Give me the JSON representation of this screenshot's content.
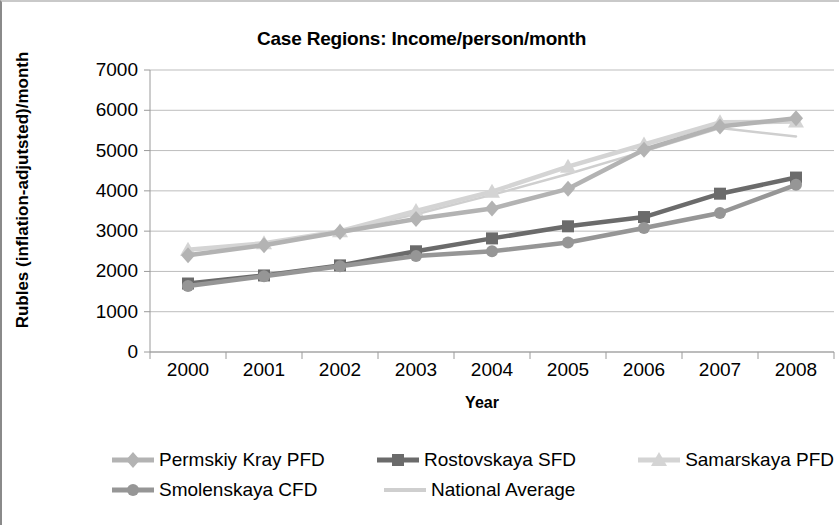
{
  "chart_data": {
    "type": "line",
    "title": "Case Regions: Income/person/month",
    "xlabel": "Year",
    "ylabel": "Rubles (inflation-adjutsted)/month",
    "categories": [
      "2000",
      "2001",
      "2002",
      "2003",
      "2004",
      "2005",
      "2006",
      "2007",
      "2008"
    ],
    "x": [
      2000,
      2001,
      2002,
      2003,
      2004,
      2005,
      2006,
      2007,
      2008
    ],
    "ylim": [
      0,
      7000
    ],
    "yticks": [
      "0",
      "1000",
      "2000",
      "3000",
      "4000",
      "5000",
      "6000",
      "7000"
    ],
    "ytick_values": [
      0,
      1000,
      2000,
      3000,
      4000,
      5000,
      6000,
      7000
    ],
    "grid": true,
    "legend_position": "bottom",
    "series": [
      {
        "name": "Permskiy Kray PFD",
        "marker": "diamond",
        "color": "#b3b3b3",
        "values": [
          2400,
          2650,
          2980,
          3300,
          3560,
          4050,
          5020,
          5600,
          5800
        ]
      },
      {
        "name": "Rostovskaya SFD",
        "marker": "square",
        "color": "#6b6b6b",
        "values": [
          1700,
          1900,
          2150,
          2500,
          2820,
          3120,
          3350,
          3930,
          4330
        ]
      },
      {
        "name": "Samarskaya PFD",
        "marker": "triangle",
        "color": "#d4d4d4",
        "values": [
          2540,
          2700,
          3000,
          3500,
          3980,
          4600,
          5150,
          5700,
          5720
        ]
      },
      {
        "name": "Smolenskaya CFD",
        "marker": "circle",
        "color": "#969696",
        "values": [
          1640,
          1880,
          2130,
          2380,
          2500,
          2720,
          3080,
          3450,
          4150
        ]
      },
      {
        "name": "National Average",
        "marker": "none",
        "color": "#cfcfcf",
        "values": [
          2400,
          2680,
          3000,
          3420,
          3900,
          4420,
          4980,
          5560,
          5350
        ]
      }
    ]
  }
}
